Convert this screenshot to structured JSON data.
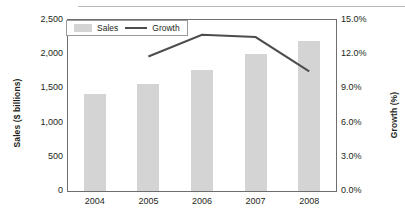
{
  "chart_data": {
    "type": "bar",
    "title": "",
    "categories": [
      "2004",
      "2005",
      "2006",
      "2007",
      "2008"
    ],
    "series": [
      {
        "name": "Sales",
        "type": "bar",
        "axis": "left",
        "values": [
          1420,
          1570,
          1770,
          2000,
          2200
        ],
        "color": "#d4d4d4"
      },
      {
        "name": "Growth",
        "type": "line",
        "axis": "right",
        "values": [
          null,
          11.8,
          13.7,
          13.5,
          10.5
        ],
        "color": "#4d4d4d"
      }
    ],
    "xlabel": "",
    "ylabel": "Sales ($ billions)",
    "y2label": "Growth (%)",
    "ylim": [
      0,
      2500
    ],
    "y2lim": [
      0,
      15
    ],
    "yticks": [
      "0",
      "500",
      "1,000",
      "1,500",
      "2,000",
      "2,500"
    ],
    "ytick_values": [
      0,
      500,
      1000,
      1500,
      2000,
      2500
    ],
    "y2ticks": [
      "0.0%",
      "3.0%",
      "6.0%",
      "9.0%",
      "12.0%",
      "15.0%"
    ],
    "y2tick_values": [
      0,
      3,
      6,
      9,
      12,
      15
    ],
    "grid": false,
    "legend_position": "top-left",
    "legend": [
      "Sales",
      "Growth"
    ]
  },
  "axes": {
    "left_title": "Sales ($ billions)",
    "right_title": "Growth (%)"
  },
  "legend": {
    "sales_label": "Sales",
    "growth_label": "Growth"
  }
}
